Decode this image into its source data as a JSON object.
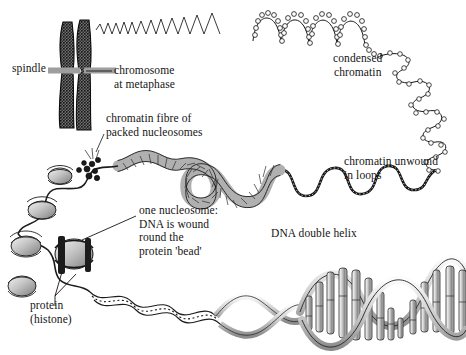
{
  "diagram": {
    "type": "biology-diagram",
    "background_color": "#ffffff",
    "ink_color": "#141414",
    "spindle_color": "#9e9e9e",
    "fibre_color": "#b0b0b0",
    "histone_color": "#c9c9c9"
  },
  "labels": {
    "spindle": "spindle",
    "chromosome": "chromosome\nat metaphase",
    "condensed": "condensed\nchromatin",
    "fibre": "chromatin fibre of\npacked nucleosomes",
    "unwound": "chromatin unwound\nin loops",
    "nucleosome": "one nucleosome:\nDNA is wound\nround the\nprotein 'bead'",
    "helix": "DNA double helix",
    "protein": "protein\n(histone)"
  },
  "structures": {
    "metaphase_chromosome": "two sister chromatids, dark stippled, joined at centromere",
    "spindle_fibre": "grey horizontal bar across centromere",
    "condensed_coil": "helical zigzag expanding left-to-right into beaded solenoid",
    "loops": "large open loops of beaded chromatin descending at right",
    "chromatin_fibre": "grey twisted ribbon of packed nucleosomes",
    "unwound_loops": "thin dotted looping strand",
    "nucleosome_beads": "grey disc-shaped histone beads with DNA coiled around",
    "dna_helix": "double helix ribbons with vertical base-pair rungs"
  }
}
